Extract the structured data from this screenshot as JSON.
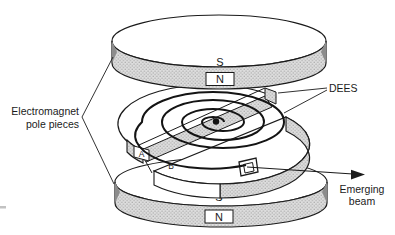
{
  "figure": {
    "type": "cyclotron-exploded-diagram",
    "background": "#ffffff",
    "ink_color": "#1b1b1b",
    "shading_color": "#dedede",
    "labels": {
      "electromagnet": {
        "line1": "Electromagnet",
        "line2": "pole pieces"
      },
      "dees": "DEES",
      "emerging_beam": {
        "line1": "Emerging",
        "line2": "beam"
      },
      "dee_a": "A",
      "dee_b": "B"
    },
    "top_pole": {
      "south": "S",
      "north": "N"
    },
    "bottom_pole": {
      "south": "S",
      "north": "N"
    }
  }
}
